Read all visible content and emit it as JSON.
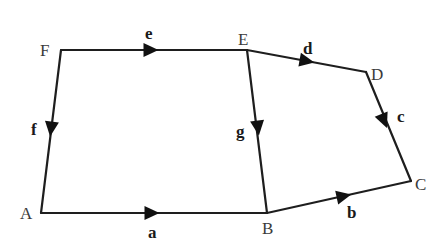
{
  "diagram": {
    "type": "directed-graph",
    "colors": {
      "line": "#1e1e1e",
      "arrow": "#111111",
      "vertex_label": "#3a3a3a",
      "edge_label": "#1a1a1a",
      "background": "#ffffff"
    },
    "vertices": [
      {
        "id": "A",
        "label": "A",
        "x": 41,
        "y": 213,
        "lx": 20,
        "ly": 219
      },
      {
        "id": "B",
        "label": "B",
        "x": 267,
        "y": 213,
        "lx": 262,
        "ly": 234
      },
      {
        "id": "C",
        "label": "C",
        "x": 411,
        "y": 181,
        "lx": 415,
        "ly": 190
      },
      {
        "id": "D",
        "label": "D",
        "x": 366,
        "y": 72,
        "lx": 371,
        "ly": 80
      },
      {
        "id": "E",
        "label": "E",
        "x": 247,
        "y": 50,
        "lx": 238,
        "ly": 45
      },
      {
        "id": "F",
        "label": "F",
        "x": 61,
        "y": 50,
        "lx": 40,
        "ly": 56
      }
    ],
    "edges": [
      {
        "id": "a",
        "label": "a",
        "from": "A",
        "to": "B",
        "ax": 152,
        "ay": 213,
        "lx": 148,
        "ly": 238
      },
      {
        "id": "b",
        "label": "b",
        "from": "B",
        "to": "C",
        "ax": 344,
        "ay": 196,
        "lx": 347,
        "ly": 218
      },
      {
        "id": "c",
        "label": "c",
        "from": "D",
        "to": "C",
        "ax": 384,
        "ay": 121,
        "lx": 397,
        "ly": 122
      },
      {
        "id": "d",
        "label": "d",
        "from": "E",
        "to": "D",
        "ax": 307,
        "ay": 61,
        "lx": 303,
        "ly": 54
      },
      {
        "id": "e",
        "label": "e",
        "from": "F",
        "to": "E",
        "ax": 151,
        "ay": 50,
        "lx": 145,
        "ly": 39
      },
      {
        "id": "f",
        "label": "f",
        "from": "F",
        "to": "A",
        "ax": 51,
        "ay": 129,
        "lx": 31,
        "ly": 135
      },
      {
        "id": "g",
        "label": "g",
        "from": "E",
        "to": "B",
        "ax": 258,
        "ay": 128,
        "lx": 236,
        "ly": 137
      }
    ]
  }
}
